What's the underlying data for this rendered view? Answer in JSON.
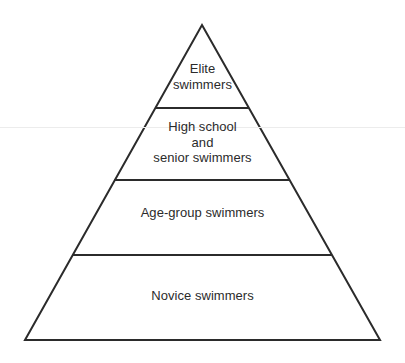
{
  "diagram": {
    "type": "pyramid",
    "background_color": "#ffffff",
    "stroke_color": "#2b2b2b",
    "text_color": "#2b2b2b",
    "geometry": {
      "apex": [
        202,
        25
      ],
      "base_left": [
        25,
        340
      ],
      "base_right": [
        380,
        340
      ],
      "divider_y": [
        108,
        180,
        255
      ]
    },
    "tiers": [
      {
        "id": "elite",
        "rank": 1,
        "position": "top",
        "label": "Elite\nswimmers"
      },
      {
        "id": "high-school-and-senior",
        "rank": 2,
        "position": "upper-middle",
        "label": "High school\nand\nsenior swimmers"
      },
      {
        "id": "age-group",
        "rank": 3,
        "position": "lower-middle",
        "label": "Age-group swimmers"
      },
      {
        "id": "novice",
        "rank": 4,
        "position": "bottom",
        "label": "Novice swimmers"
      }
    ]
  }
}
